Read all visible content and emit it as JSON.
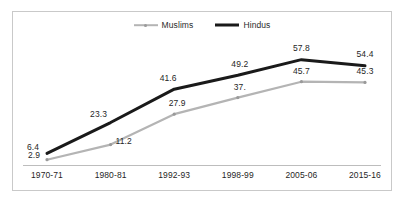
{
  "chart_data": {
    "type": "line",
    "title": "",
    "subtitle": "",
    "xlabel": "",
    "ylabel": "",
    "grid": false,
    "legend_position": "top-center",
    "ylim": [
      0,
      62
    ],
    "categories": [
      "1970-71",
      "1980-81",
      "1992-93",
      "1998-99",
      "2005-06",
      "2015-16"
    ],
    "series": [
      {
        "name": "Muslims",
        "color": "#b4b4b4",
        "values": [
          2.9,
          11.2,
          27.9,
          37.0,
          45.7,
          45.3
        ],
        "labels": [
          "2.9",
          "11.2",
          "27.9",
          "37.",
          "45.7",
          "45.3"
        ]
      },
      {
        "name": "Hindus",
        "color": "#1a1a1a",
        "values": [
          6.4,
          23.3,
          41.6,
          49.2,
          57.8,
          54.4
        ],
        "labels": [
          "6.4",
          "23.3",
          "41.6",
          "49.2",
          "57.8",
          "54.4"
        ]
      }
    ]
  },
  "legend": {
    "items": [
      {
        "label": "Muslims",
        "marker": "line-with-dot-marker"
      },
      {
        "label": "Hindus",
        "marker": "thick-line-marker"
      }
    ]
  },
  "colors": {
    "muslims_series": "#b4b4b4",
    "hindus_series": "#1a1a1a",
    "frame_border": "#c9c9c9",
    "axis_line": "#bdbdbd",
    "background": "#ffffff",
    "text": "#1f1f1f"
  }
}
